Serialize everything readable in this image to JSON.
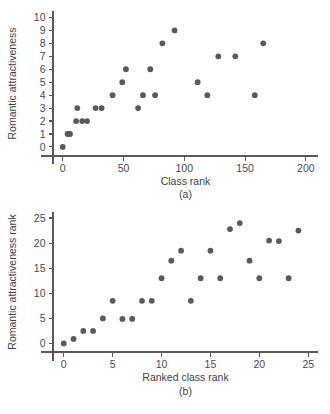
{
  "figure": {
    "background": "#ffffff",
    "point_color": "#5a5a5c",
    "axis_color": "#59595b",
    "text_color": "#3f3f41"
  },
  "panel_a": {
    "label": "(a)",
    "xlabel": "Class rank",
    "ylabel": "Romantic attractiveness",
    "xticks": [
      "0",
      "50",
      "100",
      "150",
      "200"
    ],
    "yticks": [
      "0",
      "1",
      "2",
      "3",
      "4",
      "5",
      "6",
      "7",
      "8",
      "9",
      "10"
    ]
  },
  "panel_b": {
    "label": "(b)",
    "xlabel": "Ranked class rank",
    "ylabel": "Romantic attractiveness rank",
    "xticks": [
      "0",
      "5",
      "10",
      "15",
      "20",
      "25"
    ],
    "yticks": [
      "0",
      "5",
      "10",
      "15",
      "20",
      "25"
    ]
  },
  "chart_data": [
    {
      "type": "scatter",
      "id": "panel-a",
      "title": "",
      "panel_label": "(a)",
      "xlabel": "Class rank",
      "ylabel": "Romantic attractiveness",
      "xlim": [
        -8,
        210
      ],
      "ylim": [
        -0.7,
        10.5
      ],
      "xticks": [
        0,
        50,
        100,
        150,
        200
      ],
      "yticks": [
        0,
        1,
        2,
        3,
        4,
        5,
        6,
        7,
        8,
        9,
        10
      ],
      "grid": false,
      "legend": null,
      "points": [
        {
          "x": 0,
          "y": 0
        },
        {
          "x": 4,
          "y": 1
        },
        {
          "x": 6,
          "y": 1
        },
        {
          "x": 11,
          "y": 2
        },
        {
          "x": 12,
          "y": 3
        },
        {
          "x": 16,
          "y": 2
        },
        {
          "x": 20,
          "y": 2
        },
        {
          "x": 27,
          "y": 3
        },
        {
          "x": 32,
          "y": 3
        },
        {
          "x": 41,
          "y": 4
        },
        {
          "x": 49,
          "y": 5
        },
        {
          "x": 52,
          "y": 6
        },
        {
          "x": 62,
          "y": 3
        },
        {
          "x": 66,
          "y": 4
        },
        {
          "x": 72,
          "y": 6
        },
        {
          "x": 76,
          "y": 4
        },
        {
          "x": 82,
          "y": 8
        },
        {
          "x": 92,
          "y": 9
        },
        {
          "x": 111,
          "y": 5
        },
        {
          "x": 119,
          "y": 4
        },
        {
          "x": 128,
          "y": 7
        },
        {
          "x": 142,
          "y": 7
        },
        {
          "x": 158,
          "y": 4
        },
        {
          "x": 165,
          "y": 8
        }
      ]
    },
    {
      "type": "scatter",
      "id": "panel-b",
      "title": "",
      "panel_label": "(b)",
      "xlabel": "Ranked class rank",
      "ylabel": "Romantic attractiveness rank",
      "xlim": [
        -1.1,
        26
      ],
      "ylim": [
        -1.7,
        26.2
      ],
      "xticks": [
        0,
        5,
        10,
        15,
        20,
        25
      ],
      "yticks": [
        0,
        5,
        10,
        15,
        20,
        25
      ],
      "grid": false,
      "legend": null,
      "points": [
        {
          "x": 0,
          "y": 0
        },
        {
          "x": 1,
          "y": 0.9
        },
        {
          "x": 2,
          "y": 2.5
        },
        {
          "x": 3,
          "y": 2.5
        },
        {
          "x": 4,
          "y": 5
        },
        {
          "x": 5,
          "y": 8.5
        },
        {
          "x": 6,
          "y": 4.9
        },
        {
          "x": 7,
          "y": 4.9
        },
        {
          "x": 8,
          "y": 8.5
        },
        {
          "x": 9,
          "y": 8.5
        },
        {
          "x": 10,
          "y": 13
        },
        {
          "x": 11,
          "y": 16.5
        },
        {
          "x": 12,
          "y": 18.5
        },
        {
          "x": 13,
          "y": 8.5
        },
        {
          "x": 14,
          "y": 13
        },
        {
          "x": 15,
          "y": 18.5
        },
        {
          "x": 16,
          "y": 13
        },
        {
          "x": 17,
          "y": 22.8
        },
        {
          "x": 18,
          "y": 24
        },
        {
          "x": 19,
          "y": 16.5
        },
        {
          "x": 20,
          "y": 13
        },
        {
          "x": 21,
          "y": 20.5
        },
        {
          "x": 22,
          "y": 20.4
        },
        {
          "x": 23,
          "y": 13
        },
        {
          "x": 24,
          "y": 22.5
        }
      ]
    }
  ]
}
